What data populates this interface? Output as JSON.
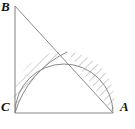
{
  "figure": {
    "type": "geometry-diagram",
    "background_color": "#ffffff",
    "stroke_color": "#8a8a8a",
    "hatch_color": "#9a9a9a",
    "label_color": "#111111",
    "canvas": {
      "width": 135,
      "height": 129
    }
  },
  "labels": {
    "B": "B",
    "C": "C",
    "A": "A"
  },
  "points": {
    "B": {
      "x": 15,
      "y": 6
    },
    "C": {
      "x": 15,
      "y": 113
    },
    "A": {
      "x": 113,
      "y": 113
    },
    "semicircle_center": {
      "x": 64,
      "y": 113
    },
    "apex": {
      "x": 67,
      "y": 52
    }
  },
  "shapes": {
    "triangle_legs": "B-C vertical, C-A horizontal, right angle at C",
    "hypotenuse": "B-A",
    "semicircle": {
      "diameter": "CA",
      "radius": 49,
      "center_x": 64,
      "center_y": 113
    },
    "arc_from_C": {
      "center": "A",
      "radius": 98,
      "from": "C",
      "to": "point on hypotenuse"
    },
    "hatched_regions": [
      "left-lens",
      "right-lune"
    ]
  }
}
